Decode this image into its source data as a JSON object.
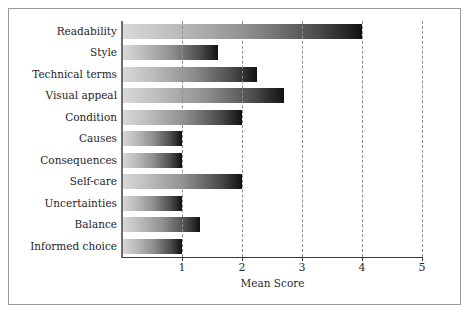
{
  "chart_data": {
    "type": "bar",
    "orientation": "horizontal",
    "title": "",
    "xlabel": "Mean Score",
    "ylabel": "",
    "xlim": [
      0,
      5
    ],
    "xticks": [
      "1",
      "2",
      "3",
      "4",
      "5"
    ],
    "xtick_values": [
      1,
      2,
      3,
      4,
      5
    ],
    "grid": true,
    "grid_axis": "x",
    "grid_style": "dashed",
    "legend": null,
    "categories": [
      "Readability",
      "Style",
      "Technical terms",
      "Visual appeal",
      "Condition",
      "Causes",
      "Consequences",
      "Self-care",
      "Uncertainties",
      "Balance",
      "Informed choice"
    ],
    "values": [
      4.0,
      1.6,
      2.25,
      2.7,
      2.0,
      1.0,
      1.0,
      2.0,
      1.0,
      1.3,
      1.0
    ],
    "series": [
      {
        "name": "Mean Score",
        "values": [
          4.0,
          1.6,
          2.25,
          2.7,
          2.0,
          1.0,
          1.0,
          2.0,
          1.0,
          1.3,
          1.0
        ]
      }
    ],
    "bar_fill": "gradient light-gray to black, left to right",
    "colors": {
      "bar_gradient_start": "#d9d9d9",
      "bar_gradient_end": "#111111",
      "gridline": "#8d8d8d",
      "axis": "#3b3b3b",
      "frame": "#9a9a9a",
      "text": "#242424",
      "background": "#ffffff"
    }
  }
}
